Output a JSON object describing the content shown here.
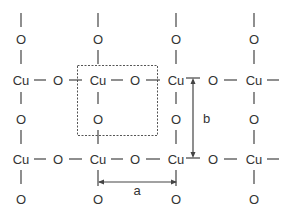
{
  "diagram": {
    "atoms": {
      "copper_label": "Cu",
      "oxygen_label": "O"
    },
    "lattice_parameters": {
      "a_label": "a",
      "b_label": "b"
    },
    "rows": [
      {
        "type": "vertical-O",
        "labels": [
          "O",
          "O",
          "O",
          "O"
        ]
      },
      {
        "type": "chain",
        "labels": [
          "Cu",
          "O",
          "Cu",
          "O",
          "Cu",
          "O",
          "Cu"
        ]
      },
      {
        "type": "vertical-O",
        "labels": [
          "O",
          "O",
          "O",
          "O"
        ]
      },
      {
        "type": "chain",
        "labels": [
          "Cu",
          "O",
          "Cu",
          "O",
          "Cu",
          "O",
          "Cu"
        ]
      },
      {
        "type": "vertical-O",
        "labels": [
          "O",
          "O",
          "O",
          "O"
        ]
      }
    ],
    "colors": {
      "line": "#444444",
      "text": "#333333",
      "background": "#ffffff"
    }
  }
}
